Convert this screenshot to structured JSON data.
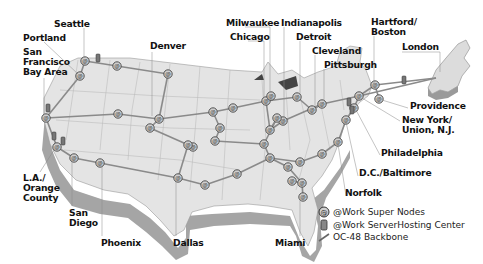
{
  "map": {
    "title": "@Work network map",
    "cities": [
      {
        "id": "seattle",
        "label": "Seattle"
      },
      {
        "id": "portland",
        "label": "Portland"
      },
      {
        "id": "sf",
        "label": "San\nFrancisco\nBay Area"
      },
      {
        "id": "denver",
        "label": "Denver"
      },
      {
        "id": "milwaukee",
        "label": "Milwaukee"
      },
      {
        "id": "chicago",
        "label": "Chicago"
      },
      {
        "id": "indianapolis",
        "label": "Indianapolis"
      },
      {
        "id": "detroit",
        "label": "Detroit"
      },
      {
        "id": "cleveland",
        "label": "Cleveland"
      },
      {
        "id": "pittsburgh",
        "label": "Pittsburgh"
      },
      {
        "id": "hartford",
        "label": "Hartford/\nBoston"
      },
      {
        "id": "london",
        "label": "London"
      },
      {
        "id": "providence",
        "label": "Providence"
      },
      {
        "id": "newyork",
        "label": "New York/\nUnion, N.J."
      },
      {
        "id": "philadelphia",
        "label": "Philadelphia"
      },
      {
        "id": "dc",
        "label": "D.C./Baltimore"
      },
      {
        "id": "norfolk",
        "label": "Norfolk"
      },
      {
        "id": "la",
        "label": "L.A./\nOrange\nCounty"
      },
      {
        "id": "sandiego",
        "label": "San\nDiego"
      },
      {
        "id": "phoenix",
        "label": "Phoenix"
      },
      {
        "id": "dallas",
        "label": "Dallas"
      },
      {
        "id": "miami",
        "label": "Miami"
      }
    ]
  },
  "legend": {
    "items": [
      {
        "icon": "super-node-icon",
        "label": "@Work Super Nodes"
      },
      {
        "icon": "server-hosting-icon",
        "label": "@Work ServerHosting Center"
      },
      {
        "icon": "backbone-line-icon",
        "label": "OC-48 Backbone"
      }
    ]
  },
  "colors": {
    "land": "#e6e6e6",
    "land_side": "#a8a8a8",
    "borders": "#bdbdbd",
    "backbone": "#8a8a8a",
    "node": "#cfcfcf",
    "label": "#111111"
  }
}
